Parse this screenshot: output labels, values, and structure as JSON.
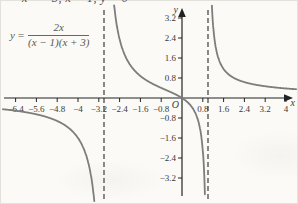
{
  "top_text": "x = −3, x = 1, y = 0",
  "equation": {
    "lhs": "y",
    "equals": "=",
    "numerator": "2x",
    "denominator": "(x − 1)(x + 3)"
  },
  "chart_data": {
    "type": "line",
    "function": {
      "label": "y = 2x/((x − 1)(x + 3))",
      "numerator_coeffs": [
        2,
        0
      ],
      "denominator_roots": [
        1,
        -3
      ]
    },
    "vertical_asymptotes": [
      -3,
      1
    ],
    "horizontal_asymptote": 0,
    "x_ticks": [
      "-6.4",
      "-5.6",
      "-4.8",
      "-4",
      "-3.2",
      "-2.4",
      "-1.6",
      "-0.8",
      "0.8",
      "1.6",
      "2.4",
      "3.2",
      "4"
    ],
    "y_ticks": [
      "3.2",
      "2.4",
      "1.6",
      "0.8",
      "-0.8",
      "-1.6",
      "-2.4",
      "-3.2"
    ],
    "x_range": [
      -6.92,
      4.42
    ],
    "y_range": [
      -4.1,
      3.75
    ],
    "origin_label": "O",
    "axis_labels": {
      "x": "x",
      "y": "y"
    },
    "grid": "off",
    "colors": {
      "curve": "#7d7d7d",
      "axis": "#232323",
      "asymptote": "#4d4d4d",
      "tick_label": "#3a3a3a"
    }
  }
}
